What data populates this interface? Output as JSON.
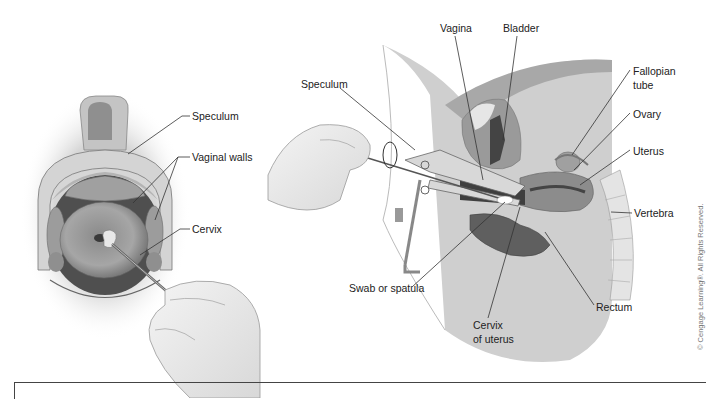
{
  "figure": {
    "left_panel": {
      "title": "Speculum view of cervix",
      "labels": {
        "speculum": "Speculum",
        "vaginal_walls": "Vaginal walls",
        "cervix": "Cervix"
      }
    },
    "right_panel": {
      "title": "Sagittal section with speculum and swab",
      "labels": {
        "speculum": "Speculum",
        "vagina": "Vagina",
        "bladder": "Bladder",
        "fallopian_tube_1": "Fallopian",
        "fallopian_tube_2": "tube",
        "ovary": "Ovary",
        "uterus": "Uterus",
        "vertebra": "Vertebra",
        "swab": "Swab or spatula",
        "cervix_uterus_1": "Cervix",
        "cervix_uterus_2": "of uterus",
        "rectum": "Rectum"
      }
    },
    "copyright": "© Cengage Learning®. All Rights Reserved."
  },
  "colors": {
    "tissue_light": "#c8c8c8",
    "tissue_mid": "#9a9a9a",
    "tissue_dark": "#5a5a5a",
    "label_text": "#222222",
    "leader_line": "#333333"
  }
}
